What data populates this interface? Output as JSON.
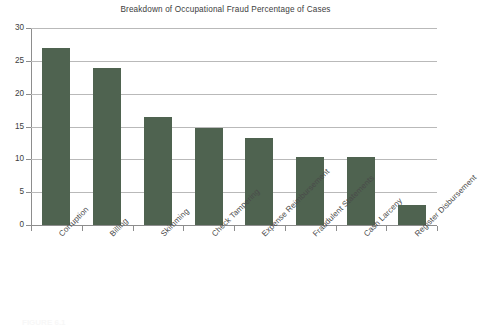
{
  "chart_data": {
    "type": "bar",
    "title": "Breakdown of Occupational Fraud Percentage of Cases",
    "xlabel": "",
    "ylabel": "",
    "ylim": [
      0,
      30
    ],
    "ytick_step": 5,
    "yticks": [
      "0",
      "5",
      "10",
      "15",
      "20",
      "25",
      "30"
    ],
    "grid": true,
    "legend": false,
    "bar_color": "#4f6350",
    "gridline_color": "#b9b9b9",
    "axis_color": "#8d8d8d",
    "categories": [
      "Corruption",
      "Billing",
      "Skimming",
      "Check Tampering",
      "Expense Reimbursement",
      "Fraudulent Statements",
      "Cash Larceny",
      "Register Disbursement"
    ],
    "values": [
      27.0,
      23.9,
      16.5,
      14.7,
      13.2,
      10.3,
      10.3,
      3.0
    ]
  },
  "footer": {
    "caption": "FIGURE 6.1"
  }
}
